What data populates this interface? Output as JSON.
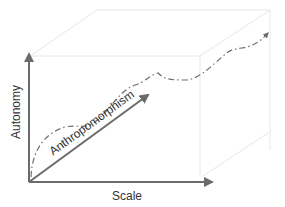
{
  "diagram": {
    "axes": {
      "x_label": "Scale",
      "y_label": "Autonomy",
      "z_label": "Anthropomorphism"
    },
    "colors": {
      "axis": "#6b6b6b",
      "box_edge": "#e6e6e6",
      "curve": "#6e6e6e",
      "text": "#333333",
      "background": "#ffffff"
    },
    "curve_style": "dash-dot with arrowhead"
  }
}
